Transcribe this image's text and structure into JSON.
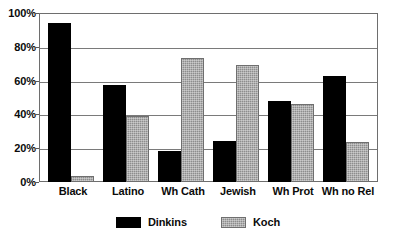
{
  "chart_data": {
    "type": "bar",
    "title": "",
    "subtitle": "",
    "xlabel": "",
    "ylabel": "",
    "categories": [
      "Black",
      "Latino",
      "Wh Cath",
      "Jewish",
      "Wh Prot",
      "Wh no Rel"
    ],
    "series": [
      {
        "name": "Dinkins",
        "color": "#000000",
        "values": [
          94,
          57.5,
          18.5,
          24.5,
          48,
          62.5
        ]
      },
      {
        "name": "Koch",
        "color": "#8d8d8d",
        "values": [
          3.5,
          39,
          73.5,
          69,
          46,
          23.5
        ]
      }
    ],
    "ylim": [
      0,
      100
    ],
    "ytick_values": [
      0,
      20,
      40,
      60,
      80,
      100
    ],
    "ytick_labels": [
      "0%",
      "20%",
      "40%",
      "60%",
      "80%",
      "100%"
    ],
    "grid": true,
    "grid_axis": "y",
    "legend_position": "bottom-center",
    "legend_entries": [
      "Dinkins",
      "Koch"
    ],
    "value_suffix": "%"
  }
}
